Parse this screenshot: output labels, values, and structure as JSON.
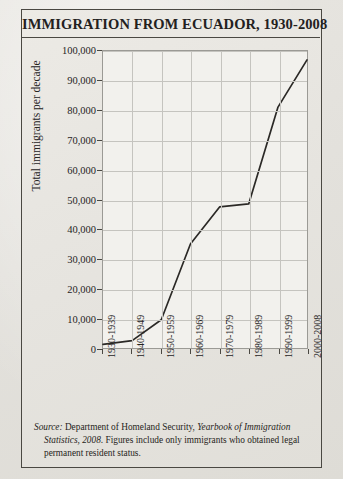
{
  "figure": {
    "title": "IMMIGRATION FROM ECUADOR, 1930-2008",
    "source_prefix": "Source:",
    "source_agency": " Department of Homeland Security, ",
    "source_publication": "Yearbook of Immigration Statistics, 2008",
    "source_rest": ". Figures include only immigrants who obtained legal permanent resident status."
  },
  "chart_data": {
    "type": "line",
    "title": "IMMIGRATION FROM ECUADOR, 1930-2008",
    "xlabel": "",
    "ylabel": "Total immigrants per decade",
    "categories": [
      "1930-1939",
      "1940-1949",
      "1950-1959",
      "1960-1969",
      "1970-1979",
      "1980-1989",
      "1990-1999",
      "2000-2008"
    ],
    "values": [
      1200,
      2500,
      9500,
      35000,
      47500,
      48500,
      81000,
      97000
    ],
    "ylim": [
      0,
      100000
    ],
    "ytick_values": [
      0,
      10000,
      20000,
      30000,
      40000,
      50000,
      60000,
      70000,
      80000,
      90000,
      100000
    ],
    "ytick_labels": [
      "0",
      "10,000",
      "20,000",
      "30,000",
      "40,000",
      "50,000",
      "60,000",
      "70,000",
      "80,000",
      "90,000",
      "100,000"
    ],
    "grid": true,
    "legend": "none",
    "line_color": "#2b2926"
  },
  "colors": {
    "page": "#e6e4df",
    "frame": "#4a4842",
    "plot_background": "#f2f1ed",
    "gridline": "#c5c4bf",
    "line": "#2b2926",
    "text": "#26241f"
  }
}
